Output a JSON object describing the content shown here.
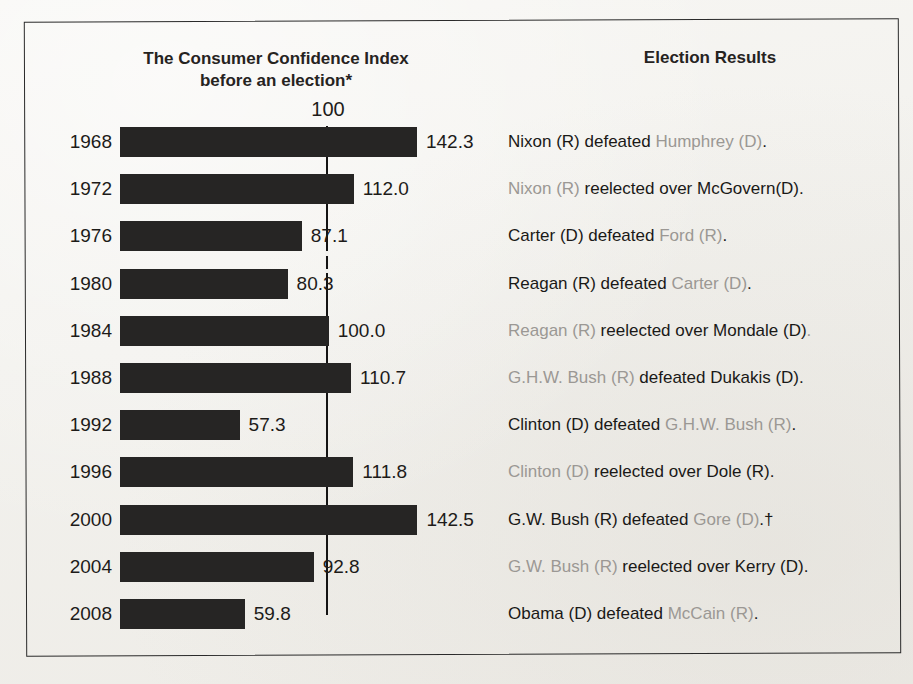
{
  "figure": {
    "title": "Consumer Confidence and Presidential Elections",
    "title_visible_fragment": "nce and Presidential Elections"
  },
  "headers": {
    "left_line1": "The Consumer Confidence Index",
    "left_line2": "before an election*",
    "right": "Election Results"
  },
  "reference": {
    "label": "100",
    "value": 100
  },
  "colors": {
    "bar": "#262524",
    "ink": "#1d1b19",
    "dimmed_text": "#9b9894",
    "paper": "#f3f2ef",
    "frame": "#2a2a2a"
  },
  "chart_data": {
    "type": "bar",
    "orientation": "horizontal",
    "title": "Consumer Confidence and Presidential Elections",
    "xlabel": "The Consumer Confidence Index before an election*",
    "ylabel": "",
    "categories": [
      "1968",
      "1972",
      "1976",
      "1980",
      "1984",
      "1988",
      "1992",
      "1996",
      "2000",
      "2004",
      "2008"
    ],
    "values": [
      142.3,
      112.0,
      87.1,
      80.3,
      100.0,
      110.7,
      57.3,
      111.8,
      142.5,
      92.8,
      59.8
    ],
    "value_labels": [
      "142.3",
      "112.0",
      "87.1",
      "80.3",
      "100.0",
      "110.7",
      "57.3",
      "111.8",
      "142.5",
      "92.8",
      "59.8"
    ],
    "xlim": [
      0,
      150
    ],
    "reference_line": 100,
    "grid": false,
    "legend": null,
    "annotations": [
      "100"
    ]
  },
  "rows": [
    {
      "year": "1968",
      "value": 142.3,
      "value_label": "142.3",
      "result_parts": [
        {
          "text": "Nixon (R) defeated ",
          "dim": false
        },
        {
          "text": "Humphrey (D)",
          "dim": true
        },
        {
          "text": ".",
          "dim": false
        }
      ],
      "result_plain": "Nixon (R) defeated Humphrey (D)."
    },
    {
      "year": "1972",
      "value": 112.0,
      "value_label": "112.0",
      "result_parts": [
        {
          "text": "Nixon (R) ",
          "dim": true
        },
        {
          "text": "reelected over McGovern(D).",
          "dim": false
        }
      ],
      "result_plain": "Nixon (R) reelected over McGovern(D)."
    },
    {
      "year": "1976",
      "value": 87.1,
      "value_label": "87.1",
      "result_parts": [
        {
          "text": "Carter (D) defeated ",
          "dim": false
        },
        {
          "text": "Ford (R)",
          "dim": true
        },
        {
          "text": ".",
          "dim": false
        }
      ],
      "result_plain": "Carter (D) defeated Ford (R)."
    },
    {
      "year": "1980",
      "value": 80.3,
      "value_label": "80.3",
      "result_parts": [
        {
          "text": "Reagan (R) defeated ",
          "dim": false
        },
        {
          "text": "Carter (D)",
          "dim": true
        },
        {
          "text": ".",
          "dim": false
        }
      ],
      "result_plain": "Reagan (R) defeated Carter (D)."
    },
    {
      "year": "1984",
      "value": 100.0,
      "value_label": "100.0",
      "result_parts": [
        {
          "text": "Reagan (R) ",
          "dim": true
        },
        {
          "text": "reelected over Mondale (D)",
          "dim": false
        },
        {
          "text": ".",
          "dim": true
        }
      ],
      "result_plain": "Reagan (R) reelected over Mondale (D)."
    },
    {
      "year": "1988",
      "value": 110.7,
      "value_label": "110.7",
      "result_parts": [
        {
          "text": "G.H.W. Bush (R) ",
          "dim": true
        },
        {
          "text": "defeated Dukakis (D).",
          "dim": false
        }
      ],
      "result_plain": "G.H.W. Bush (R) defeated Dukakis (D)."
    },
    {
      "year": "1992",
      "value": 57.3,
      "value_label": "57.3",
      "result_parts": [
        {
          "text": "Clinton (D) defeated ",
          "dim": false
        },
        {
          "text": "G.H.W. Bush (R)",
          "dim": true
        },
        {
          "text": ".",
          "dim": false
        }
      ],
      "result_plain": "Clinton (D) defeated G.H.W. Bush (R)."
    },
    {
      "year": "1996",
      "value": 111.8,
      "value_label": "111.8",
      "result_parts": [
        {
          "text": "Clinton (D) ",
          "dim": true
        },
        {
          "text": "reelected over Dole (R).",
          "dim": false
        }
      ],
      "result_plain": "Clinton (D) reelected over Dole (R)."
    },
    {
      "year": "2000",
      "value": 142.5,
      "value_label": "142.5",
      "result_parts": [
        {
          "text": "G.W. Bush (R) defeated ",
          "dim": false
        },
        {
          "text": "Gore (D)",
          "dim": true
        },
        {
          "text": ".†",
          "dim": false
        }
      ],
      "result_plain": "G.W. Bush (R) defeated Gore (D).†"
    },
    {
      "year": "2004",
      "value": 92.8,
      "value_label": "92.8",
      "result_parts": [
        {
          "text": "G.W. Bush (R) ",
          "dim": true
        },
        {
          "text": "reelected over Kerry (D).",
          "dim": false
        }
      ],
      "result_plain": "G.W. Bush (R) reelected over Kerry (D)."
    },
    {
      "year": "2008",
      "value": 59.8,
      "value_label": "59.8",
      "result_parts": [
        {
          "text": "Obama (D) defeated ",
          "dim": false
        },
        {
          "text": "McCain (R)",
          "dim": true
        },
        {
          "text": ".",
          "dim": false
        }
      ],
      "result_plain": "Obama (D) defeated McCain (R)."
    }
  ]
}
